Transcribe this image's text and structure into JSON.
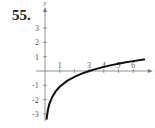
{
  "problem_number": "55.",
  "chart_data": {
    "type": "line",
    "title": "",
    "xlabel": "x",
    "ylabel": "y",
    "xlim": [
      -0.6,
      7.0
    ],
    "ylim": [
      -3.5,
      4.2
    ],
    "x_ticks": [
      1,
      2,
      3,
      4,
      5,
      6
    ],
    "x_tick_labels": [
      "1",
      "",
      "3",
      "4",
      "5",
      "6"
    ],
    "y_ticks": [
      -3,
      -2,
      -1,
      1,
      2,
      3
    ],
    "y_tick_labels": [
      "-3",
      "-2",
      "-1",
      "1",
      "2",
      "3"
    ],
    "grid": false,
    "series": [
      {
        "name": "curve",
        "x": [
          0.1,
          0.2,
          0.3,
          0.5,
          0.75,
          1,
          1.5,
          2,
          2.5,
          3,
          3.5,
          4,
          4.5,
          5,
          5.5,
          6,
          6.5,
          6.8
        ],
        "y": [
          -3.4,
          -2.71,
          -2.3,
          -1.79,
          -1.39,
          -1.1,
          -0.69,
          -0.41,
          -0.18,
          0.0,
          0.15,
          0.29,
          0.41,
          0.51,
          0.61,
          0.69,
          0.77,
          0.82
        ]
      }
    ]
  },
  "axes": {
    "x_label": "x",
    "y_label": "y"
  }
}
